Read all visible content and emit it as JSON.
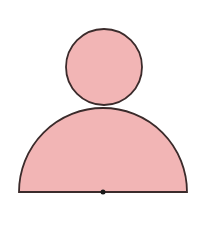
{
  "diagram": {
    "colors": {
      "fill": "#f2b5b5",
      "stroke": "#3b2b2b",
      "background": "#ffffff",
      "dot": "#1a1a1a"
    },
    "circle": {
      "cx": 104,
      "cy": 67,
      "r": 38
    },
    "semicircle": {
      "cx": 103,
      "cy": 192,
      "r": 84
    },
    "center_dot": {
      "cx": 103,
      "cy": 192,
      "r": 2.5
    }
  }
}
